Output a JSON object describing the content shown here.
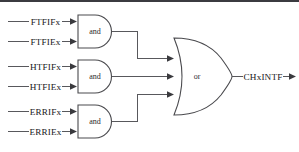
{
  "diagram": {
    "type": "logic-gate-diagram",
    "colors": {
      "wire": "#58585c",
      "gate_stroke": "#4a4a4e",
      "gate_fill": "#ffffff",
      "text": "#17171a",
      "background": "#ffffff"
    },
    "and_gates": [
      {
        "id": "and-gate-1",
        "label": "and",
        "inputs": [
          {
            "name": "ftfifx-input",
            "label": "FTFIFx"
          },
          {
            "name": "ftfiex-input",
            "label": "FTFIEx"
          }
        ]
      },
      {
        "id": "and-gate-2",
        "label": "and",
        "inputs": [
          {
            "name": "htfifx-input",
            "label": "HTFIFx"
          },
          {
            "name": "htfiex-input",
            "label": "HTFIEx"
          }
        ]
      },
      {
        "id": "and-gate-3",
        "label": "and",
        "inputs": [
          {
            "name": "errifx-input",
            "label": "ERRIFx"
          },
          {
            "name": "erriex-input",
            "label": "ERRIEx"
          }
        ]
      }
    ],
    "or_gate": {
      "id": "or-gate",
      "label": "or",
      "output": {
        "name": "chxintf-output",
        "label": "CHxINTF"
      }
    }
  }
}
